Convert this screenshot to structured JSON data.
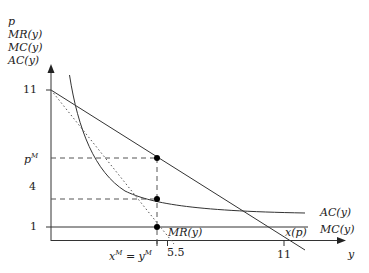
{
  "diagram": {
    "type": "economics-monopoly-pricing",
    "axis_labels": {
      "y_axis": [
        "p",
        "MR(y)",
        "MC(y)",
        "AC(y)"
      ],
      "x_axis": "y"
    },
    "y_ticks": [
      {
        "label": "11",
        "value": 11
      },
      {
        "label": "p",
        "sup": "M",
        "value": 6
      },
      {
        "label": "4",
        "value": 3
      },
      {
        "label": "1",
        "value": 1
      }
    ],
    "x_ticks": [
      {
        "label": "x",
        "sup1": "M",
        "mid": " = y",
        "sup2": "M",
        "value": 5
      },
      {
        "label": "5.5",
        "value": 5.5
      },
      {
        "label": "11",
        "value": 11
      }
    ],
    "curves": {
      "demand": {
        "label": "x(p)",
        "equation": "p = 11 - y"
      },
      "marginal_revenue": {
        "label": "MR(y)",
        "equation": "p = 11 - 2y",
        "style": "dotted"
      },
      "marginal_cost": {
        "label": "MC(y)",
        "value": 1
      },
      "average_cost": {
        "label": "AC(y)",
        "equation": "1 + 10/y"
      }
    },
    "points": [
      {
        "name": "monopoly-price-point",
        "y": 5,
        "p": 6
      },
      {
        "name": "average-cost-point",
        "y": 5,
        "p": 3
      },
      {
        "name": "mr-equals-mc-point",
        "y": 5,
        "p": 1
      }
    ],
    "colors": {
      "line": "#333333",
      "dashed": "#555555",
      "point": "#000000"
    }
  }
}
